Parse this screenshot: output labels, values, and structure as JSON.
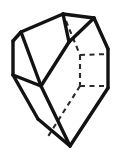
{
  "figure": {
    "background_color": "#ffffff",
    "visible_edge_color": "#121212",
    "hidden_edge_color": "#2a2a2a",
    "visible_edge_width": 3.4,
    "hidden_edge_width": 2.1,
    "hidden_edge_dash": "5 4",
    "canvas": {
      "width": 118,
      "height": 151
    },
    "vertices": {
      "top_left_ridge": [
        63,
        14
      ],
      "top_right_peak": [
        94,
        18
      ],
      "upper_left_corner": [
        21,
        32
      ],
      "left_upper": [
        13,
        41
      ],
      "left_lower": [
        13,
        75
      ],
      "front_mid_left": [
        41,
        86
      ],
      "front_ridge_top": [
        69,
        42
      ],
      "bottom_apex": [
        70,
        146
      ],
      "bottom_left_foot": [
        38,
        119
      ],
      "right_upper": [
        108,
        49
      ],
      "right_lower": [
        108,
        88
      ],
      "hidden_back_top": [
        78,
        26
      ],
      "hidden_corner_upper": [
        80,
        55
      ],
      "hidden_corner_lower": [
        80,
        86
      ],
      "hidden_back_bottom": [
        58,
        126
      ]
    },
    "faces": [
      {
        "name": "top-face",
        "kind": "visible",
        "points": "63,14 94,18 69,42 41,86 21,32"
      },
      {
        "name": "left-face",
        "kind": "visible",
        "points": "21,32 41,86 13,75 13,41"
      },
      {
        "name": "front-left-face",
        "kind": "visible",
        "points": "13,75 41,86 70,146 38,119"
      },
      {
        "name": "front-right-face",
        "kind": "visible",
        "points": "41,86 69,42 108,88 70,146"
      },
      {
        "name": "right-face",
        "kind": "visible",
        "points": "94,18 108,49 108,88 69,42"
      }
    ],
    "edges_visible": [
      {
        "name": "top-ridge",
        "path": "M63,14 L94,18"
      },
      {
        "name": "top-left-edge",
        "path": "M63,14 L21,32"
      },
      {
        "name": "top-front-ridge",
        "path": "M63,14 L69,42"
      },
      {
        "name": "left-upper-edge",
        "path": "M21,32 L13,41"
      },
      {
        "name": "left-vertical-edge",
        "path": "M13,41 L13,75"
      },
      {
        "name": "left-mid-edge",
        "path": "M21,32 L41,86"
      },
      {
        "name": "left-bottom-edge",
        "path": "M13,75 L41,86"
      },
      {
        "name": "front-diagonal-edge",
        "path": "M41,86 L69,42"
      },
      {
        "name": "front-left-long-edge",
        "path": "M13,75 L38,119"
      },
      {
        "name": "bottom-left-edge",
        "path": "M38,119 L70,146"
      },
      {
        "name": "front-center-edge",
        "path": "M41,86 L70,146"
      },
      {
        "name": "bottom-right-edge",
        "path": "M70,146 L108,88"
      },
      {
        "name": "right-vertical-edge",
        "path": "M108,49 L108,88"
      },
      {
        "name": "right-upper-edge",
        "path": "M94,18 L108,49"
      },
      {
        "name": "top-right-edge",
        "path": "M94,18 L69,42"
      }
    ],
    "edges_hidden": [
      {
        "name": "hidden-back-vertical-upper",
        "path": "M66,21 L80,55"
      },
      {
        "name": "hidden-back-vertical-lower",
        "path": "M80,55 L80,86"
      },
      {
        "name": "hidden-back-top-horizontal",
        "path": "M80,55 L108,54"
      },
      {
        "name": "hidden-back-bottom-horizontal",
        "path": "M80,86 L108,86"
      },
      {
        "name": "hidden-back-diagonal",
        "path": "M80,86 L47,138"
      }
    ]
  }
}
